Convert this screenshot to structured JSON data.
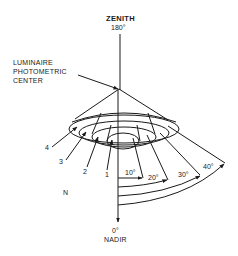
{
  "diagram": {
    "labels": {
      "zenith": "ZENITH",
      "zenith_angle": "180°",
      "nadir": "NADIR",
      "nadir_angle": "0°",
      "center_line1": "LUMINAIRE",
      "center_line2": "PHOTOMETRIC",
      "center_line3": "CENTER",
      "north": "N"
    },
    "cones": [
      {
        "number": "1",
        "angle": "10°"
      },
      {
        "number": "2",
        "angle": "20°"
      },
      {
        "number": "3",
        "angle": "30°"
      },
      {
        "number": "4",
        "angle": "40°"
      }
    ],
    "colors": {
      "line": "#1a1a1a",
      "background": "#ffffff"
    }
  }
}
